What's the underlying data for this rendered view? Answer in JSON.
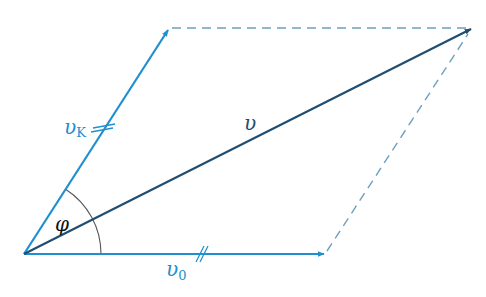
{
  "colors": {
    "light_blue": "#1f8fd0",
    "dark_blue": "#1f4e72",
    "dashed": "#6e9fc0",
    "arc": "#555555"
  },
  "labels": {
    "v": "υ",
    "v_k": "υ",
    "v_k_sub": "K",
    "v_0": "υ",
    "v_0_sub": "0",
    "phi": "φ"
  },
  "vectors": [
    {
      "name": "v_K",
      "from": [
        24,
        254
      ],
      "to": [
        169,
        28
      ],
      "color": "light_blue"
    },
    {
      "name": "v",
      "from": [
        24,
        254
      ],
      "to": [
        472,
        28
      ],
      "color": "dark_blue"
    },
    {
      "name": "v_0",
      "from": [
        24,
        254
      ],
      "to": [
        325,
        254
      ],
      "color": "light_blue"
    }
  ],
  "dashed_lines": [
    {
      "from": [
        169,
        28
      ],
      "to": [
        472,
        28
      ]
    },
    {
      "from": [
        325,
        254
      ],
      "to": [
        472,
        28
      ]
    }
  ],
  "tick_marks": {
    "v_K": "double-tick",
    "v_0": "double-tick"
  },
  "angle": {
    "label": "φ",
    "between": [
      "v_0",
      "v_K"
    ],
    "radius": 77
  }
}
